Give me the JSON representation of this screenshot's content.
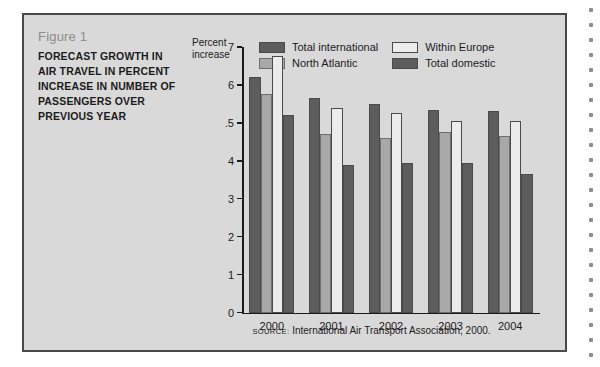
{
  "figure": {
    "number_label": "Figure 1",
    "title": "FORECAST GROWTH IN AIR TRAVEL IN PERCENT INCREASE IN NUMBER OF PASSENGERS OVER PREVIOUS YEAR"
  },
  "source": {
    "word": "SOURCE:",
    "text": "International Air Transport Association, 2000."
  },
  "colors": {
    "total_international": "#5d5d5d",
    "north_atlantic": "#a8a8a8",
    "within_europe": "#ececec",
    "total_domestic": "#5d5d5d",
    "panel_background": "#d9d9d9",
    "frame_border": "#4a4a4a",
    "axis": "#1b1b1b",
    "figure_number_text": "#8d8d8d"
  },
  "chart_data": {
    "type": "bar",
    "title": "FORECAST GROWTH IN AIR TRAVEL IN PERCENT INCREASE IN NUMBER OF PASSENGERS OVER PREVIOUS YEAR",
    "subtitle": "Figure 1",
    "xlabel": "",
    "ylabel": "Percent increase",
    "ylim": [
      0,
      7
    ],
    "yticks": [
      0,
      1,
      2,
      3,
      4,
      5,
      6,
      7
    ],
    "ytick_labels": [
      "0",
      "1",
      "2",
      "3",
      "4",
      ".5",
      "6",
      "7"
    ],
    "grid": false,
    "legend_position": "top-right",
    "categories": [
      "2000",
      "2001",
      "2002",
      "2003",
      "2004"
    ],
    "series": [
      {
        "name": "Total international",
        "color": "#5d5d5d",
        "values": [
          6.2,
          5.65,
          5.5,
          5.35,
          5.3
        ]
      },
      {
        "name": "North Atlantic",
        "color": "#a8a8a8",
        "values": [
          5.75,
          4.7,
          4.6,
          4.75,
          4.65
        ]
      },
      {
        "name": "Within Europe",
        "color": "#ececec",
        "values": [
          6.75,
          5.4,
          5.25,
          5.05,
          5.05
        ]
      },
      {
        "name": "Total domestic",
        "color": "#5d5d5d",
        "values": [
          5.2,
          3.9,
          3.95,
          3.95,
          3.65
        ]
      }
    ],
    "annotations": [
      "SOURCE: International Air Transport Association, 2000."
    ]
  }
}
